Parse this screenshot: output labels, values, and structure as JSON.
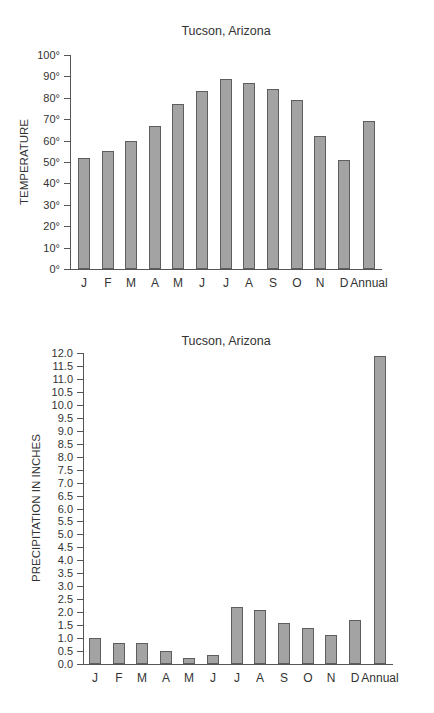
{
  "chart_data": [
    {
      "type": "bar",
      "title": "Tucson, Arizona",
      "xlabel": "",
      "ylabel": "TEMPERATURE",
      "unit_suffix": "°",
      "categories": [
        "J",
        "F",
        "M",
        "A",
        "M",
        "J",
        "J",
        "A",
        "S",
        "O",
        "N",
        "D",
        "Annual"
      ],
      "values": [
        52,
        55,
        60,
        67,
        77,
        83,
        89,
        87,
        84,
        79,
        62,
        51,
        69
      ],
      "ylim": [
        0,
        100
      ],
      "yticks": [
        0,
        10,
        20,
        30,
        40,
        50,
        60,
        70,
        80,
        90,
        100
      ],
      "ytick_labels": [
        "0°",
        "10°",
        "20°",
        "30°",
        "40°",
        "50°",
        "60°",
        "70°",
        "80°",
        "90°",
        "100°"
      ],
      "grid": false,
      "legend": null
    },
    {
      "type": "bar",
      "title": "Tucson, Arizona",
      "xlabel": "",
      "ylabel": "PRECIPITATION IN INCHES",
      "categories": [
        "J",
        "F",
        "M",
        "A",
        "M",
        "J",
        "J",
        "A",
        "S",
        "O",
        "N",
        "D",
        "Annual"
      ],
      "values": [
        1.0,
        0.8,
        0.8,
        0.5,
        0.25,
        0.35,
        2.2,
        2.1,
        1.6,
        1.4,
        1.1,
        1.7,
        11.9
      ],
      "ylim": [
        0,
        12
      ],
      "yticks": [
        0,
        0.5,
        1,
        1.5,
        2,
        2.5,
        3,
        3.5,
        4,
        4.5,
        5,
        5.5,
        6,
        6.5,
        7,
        7.5,
        8,
        8.5,
        9,
        9.5,
        10,
        10.5,
        11,
        11.5,
        12
      ],
      "ytick_labels": [
        "0.0",
        "0.5",
        "1.0",
        "1.5",
        "2.0",
        "2.5",
        "3.0",
        "3.5",
        "4.0",
        "4.5",
        "5.0",
        "5.5",
        "6.0",
        "6.5",
        "7.0",
        "7.5",
        "8.0",
        "8.5",
        "9.0",
        "9.5",
        "10.0",
        "10.5",
        "11.0",
        "11.5",
        "12.0"
      ],
      "grid": false,
      "legend": null
    }
  ],
  "colors": {
    "bar_fill": "#a3a3a3",
    "bar_border": "#5e5e5e",
    "axis": "#555555",
    "text": "#333333"
  },
  "layout": [
    {
      "title_pos": [
        226,
        24
      ],
      "ylabel_pos": [
        24,
        162
      ],
      "y_axis_x": 70,
      "y_top": 55,
      "y_bottom": 269,
      "x_axis_end": 382,
      "bar_centers": [
        84,
        108,
        131,
        155,
        178,
        202,
        226,
        249,
        273,
        297,
        320,
        344,
        369
      ],
      "bar_width": 12,
      "xlabel_y": 276
    },
    {
      "title_pos": [
        226,
        334
      ],
      "ylabel_pos": [
        36,
        508
      ],
      "y_axis_x": 83,
      "y_top": 353,
      "y_bottom": 664,
      "x_axis_end": 393,
      "bar_centers": [
        95,
        119,
        142,
        166,
        189,
        213,
        237,
        260,
        284,
        308,
        331,
        355,
        380
      ],
      "bar_width": 12,
      "xlabel_y": 671
    }
  ]
}
